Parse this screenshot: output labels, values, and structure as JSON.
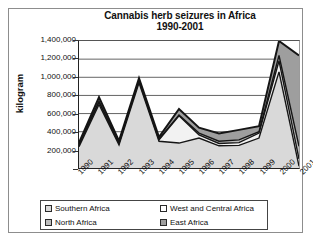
{
  "chart_data": {
    "type": "area",
    "stacked": true,
    "title": "Cannabis herb seizures in Africa 1990-2001",
    "title_line1": "Cannabis herb seizures in Africa",
    "title_line2": "1990-2001",
    "xlabel": "",
    "ylabel": "kilogram",
    "ylim": [
      0,
      1400000
    ],
    "ytick_labels": [
      "1,400,000",
      "1,200,000",
      "1,000,000",
      "800,000",
      "600,000",
      "400,000",
      "200,000",
      "-"
    ],
    "ytick_values": [
      1400000,
      1200000,
      1000000,
      800000,
      600000,
      400000,
      200000,
      0
    ],
    "grid": true,
    "legend_position": "bottom",
    "categories": [
      "1990",
      "1991",
      "1992",
      "1993",
      "1994",
      "1995",
      "1996",
      "1997",
      "1998",
      "1999",
      "2000",
      "2001"
    ],
    "series": [
      {
        "name": "Southern Africa",
        "color": "#d9d9d9",
        "values": [
          235000,
          700000,
          255000,
          940000,
          295000,
          275000,
          330000,
          245000,
          250000,
          330000,
          1060000,
          20000
        ]
      },
      {
        "name": "West and Central Africa",
        "color": "#f2f2f2",
        "values": [
          20000,
          25000,
          15000,
          20000,
          15000,
          300000,
          35000,
          25000,
          30000,
          55000,
          120000,
          80000
        ]
      },
      {
        "name": "North Africa",
        "color": "#bdbdbd",
        "values": [
          10000,
          10000,
          10000,
          10000,
          10000,
          10000,
          20000,
          25000,
          30000,
          15000,
          60000,
          140000
        ]
      },
      {
        "name": "East Africa",
        "color": "#9e9e9e",
        "values": [
          15000,
          45000,
          20000,
          20000,
          20000,
          65000,
          60000,
          85000,
          110000,
          60000,
          160000,
          1000000
        ]
      }
    ],
    "totals": [
      280000,
      780000,
      300000,
      990000,
      340000,
      650000,
      445000,
      380000,
      420000,
      460000,
      1400000,
      1240000
    ]
  },
  "legend": {
    "items": [
      {
        "label": "Southern Africa",
        "swatch": "sw-southern"
      },
      {
        "label": "West and Central Africa",
        "swatch": "sw-west"
      },
      {
        "label": "North Africa",
        "swatch": "sw-north"
      },
      {
        "label": "East Africa",
        "swatch": "sw-east"
      }
    ]
  }
}
